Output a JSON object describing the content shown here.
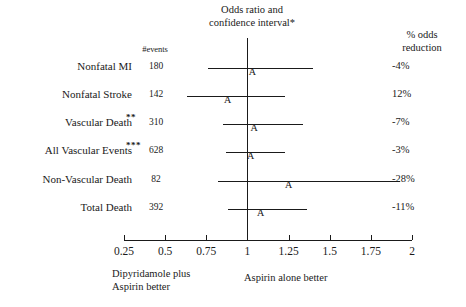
{
  "chart_data": {
    "type": "forest",
    "title": "Odds ratio and confidence interval*",
    "title_line1": "Odds ratio and",
    "title_line2": "confidence interval*",
    "right_header_line1": "% odds",
    "right_header_line2": "reduction",
    "events_header": "#events",
    "xlabel": "",
    "ylabel": "",
    "xlim": [
      0.25,
      2
    ],
    "xticks": [
      0.25,
      0.5,
      0.75,
      1,
      1.25,
      1.5,
      1.75,
      2
    ],
    "xtick_labels": [
      "0.25",
      "0.5",
      "0.75",
      "1",
      "1.25",
      "1.5",
      "1.75",
      "2"
    ],
    "null_value": 1,
    "grid": false,
    "marker_symbol": "A",
    "left_footer_line1": "Dipyridamole plus",
    "left_footer_line2": "Aspirin better",
    "right_footer": "Aspirin alone better",
    "rows": [
      {
        "label": "Nonfatal MI",
        "stars": "",
        "events": "180",
        "reduction": "-4%",
        "estimate": 1.03,
        "ci_low": 0.76,
        "ci_high": 1.4
      },
      {
        "label": "Nonfatal Stroke",
        "stars": "",
        "events": "142",
        "reduction": "12%",
        "estimate": 0.88,
        "ci_low": 0.63,
        "ci_high": 1.23
      },
      {
        "label": "Vascular Death",
        "stars": "**",
        "events": "310",
        "reduction": "-7%",
        "estimate": 1.04,
        "ci_low": 0.85,
        "ci_high": 1.34
      },
      {
        "label": "All Vascular Events",
        "stars": "***",
        "events": "628",
        "reduction": "-3%",
        "estimate": 1.02,
        "ci_low": 0.87,
        "ci_high": 1.23
      },
      {
        "label": "Non-Vascular Death",
        "stars": "",
        "events": "82",
        "reduction": "-28%",
        "estimate": 1.25,
        "ci_low": 0.82,
        "ci_high": 1.93
      },
      {
        "label": "Total Death",
        "stars": "",
        "events": "392",
        "reduction": "-11%",
        "estimate": 1.08,
        "ci_low": 0.88,
        "ci_high": 1.36
      }
    ]
  },
  "geometry": {
    "x_pixel_at_min": 124,
    "x_pixel_at_max": 412,
    "axis_y": 240,
    "null_line_top": 38,
    "row_y": [
      68,
      96,
      124,
      152,
      181,
      209
    ],
    "tick_label_y": 245
  },
  "colors": {
    "ink": "#1a1a1a",
    "background": "#ffffff"
  }
}
